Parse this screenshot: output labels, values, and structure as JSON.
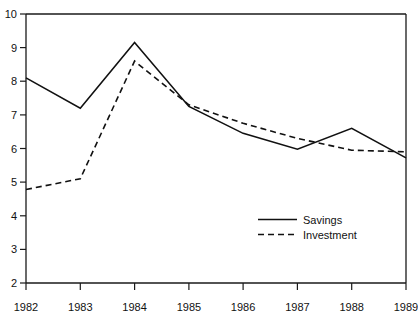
{
  "chart_data": {
    "type": "line",
    "title": "",
    "subtitle": "",
    "xlabel": "",
    "ylabel": "",
    "x": [
      1982,
      1983,
      1984,
      1985,
      1986,
      1987,
      1988,
      1989
    ],
    "categories": [
      "1982",
      "1983",
      "1984",
      "1985",
      "1986",
      "1987",
      "1988",
      "1989"
    ],
    "xlim": [
      1982,
      1989
    ],
    "ylim": [
      2,
      10
    ],
    "y_ticks": [
      2,
      3,
      4,
      5,
      6,
      7,
      8,
      9,
      10
    ],
    "y_tick_labels": [
      "2",
      "3",
      "4",
      "5",
      "6",
      "7",
      "8",
      "9",
      "10"
    ],
    "x_ticks": [
      1982,
      1983,
      1984,
      1985,
      1986,
      1987,
      1988,
      1989
    ],
    "x_tick_labels": [
      "1982",
      "1983",
      "1984",
      "1985",
      "1986",
      "1987",
      "1988",
      "1989"
    ],
    "grid": false,
    "legend_position": "center-right-inside",
    "series": [
      {
        "name": "Savings",
        "style": "solid",
        "color": "#111111",
        "values": [
          8.1,
          7.2,
          9.15,
          7.25,
          6.45,
          5.98,
          6.6,
          5.72
        ]
      },
      {
        "name": "Investment",
        "style": "dashed",
        "color": "#111111",
        "values": [
          4.78,
          5.1,
          8.6,
          7.3,
          6.75,
          6.3,
          5.95,
          5.9
        ]
      }
    ],
    "annotations": []
  },
  "legend": {
    "entries": [
      {
        "label": "Savings"
      },
      {
        "label": "Investment"
      }
    ]
  },
  "colors": {
    "line": "#111111",
    "axis": "#1a1a1a",
    "background": "#ffffff",
    "text": "#111111"
  }
}
